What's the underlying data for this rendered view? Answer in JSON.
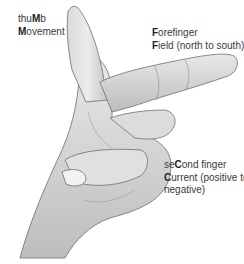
{
  "diagram": {
    "labels": {
      "thumb": {
        "line1": {
          "pre": "thu",
          "bold": "M",
          "post": "b"
        },
        "line2": {
          "pre": "",
          "bold": "M",
          "post": "ovement"
        }
      },
      "forefinger": {
        "line1": {
          "pre": "",
          "bold": "F",
          "post": "orefinger"
        },
        "line2": {
          "pre": "",
          "bold": "F",
          "post": "ield (north to south)"
        }
      },
      "second_finger": {
        "line1": {
          "pre": "se",
          "bold": "C",
          "post": "ond finger"
        },
        "line2": {
          "pre": "",
          "bold": "C",
          "post": "urrent (positive to"
        },
        "line3": {
          "pre": "",
          "bold": "",
          "post": "negative)"
        }
      }
    },
    "colors": {
      "skin_light": "#e6e6e6",
      "skin_mid": "#cfcfcf",
      "skin_dark": "#a8a8a8",
      "outline": "#6e6e6e",
      "text": "#3a3a3a"
    }
  }
}
